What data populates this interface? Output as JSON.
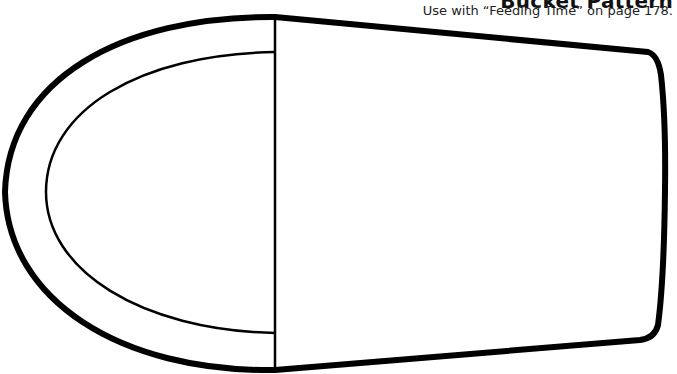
{
  "header": {
    "title": "Bucket Pattern",
    "subtitle": "Use with “Feeding Time” on page 178."
  },
  "pattern": {
    "name": "bucket",
    "stroke_color": "#000000",
    "fill_color": "#ffffff",
    "parts": [
      "bucket-handle-outer",
      "bucket-handle-inner",
      "bucket-body",
      "fold-line"
    ]
  }
}
